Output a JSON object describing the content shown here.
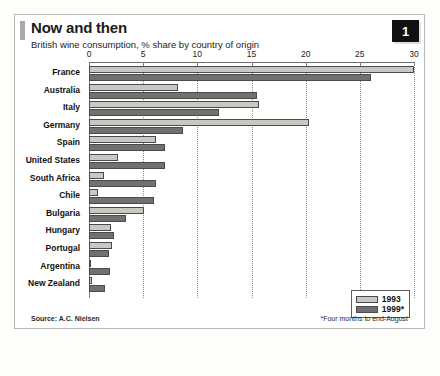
{
  "card": {
    "badge": "1",
    "headline": "Now and then",
    "subhead": "British wine consumption, % share by country of origin",
    "source": "Source: A.C. Nielsen",
    "footnote": "*Four months to end-August"
  },
  "legend": {
    "items": [
      {
        "label": "1993",
        "color": "#c9c9c4"
      },
      {
        "label": "1999*",
        "color": "#717171"
      }
    ]
  },
  "chart_data": {
    "type": "bar",
    "orientation": "horizontal",
    "title": "Now and then",
    "subtitle": "British wine consumption, % share by country of origin",
    "xlabel": "",
    "ylabel": "",
    "xlim": [
      0,
      30
    ],
    "xticks": [
      0,
      5,
      10,
      15,
      20,
      25,
      30
    ],
    "xtick_labels": [
      "0",
      "5",
      "10",
      "15",
      "20",
      "25",
      "30"
    ],
    "grid": true,
    "legend_position": "bottom-right",
    "categories": [
      "France",
      "Australia",
      "Italy",
      "Germany",
      "Spain",
      "United States",
      "South Africa",
      "Chile",
      "Bulgaria",
      "Hungary",
      "Portugal",
      "Argentina",
      "New Zealand"
    ],
    "series": [
      {
        "name": "1993",
        "color": "#c9c9c4",
        "values": [
          30.0,
          8.2,
          15.7,
          20.3,
          6.2,
          2.7,
          1.4,
          0.8,
          5.1,
          2.0,
          2.1,
          0.2,
          0.3
        ]
      },
      {
        "name": "1999*",
        "color": "#717171",
        "values": [
          26.0,
          15.5,
          12.0,
          8.7,
          7.0,
          7.0,
          6.2,
          6.0,
          3.4,
          2.3,
          1.8,
          1.9,
          1.5
        ]
      }
    ],
    "annotations": [
      "*Four months to end-August"
    ],
    "source": "Source: A.C. Nielsen"
  }
}
